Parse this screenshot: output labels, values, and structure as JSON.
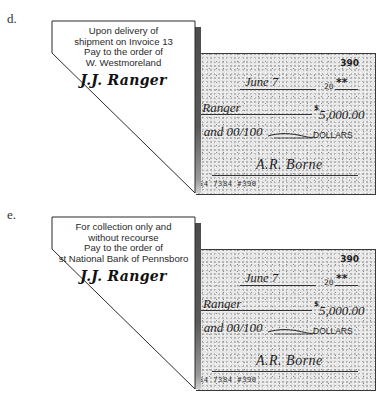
{
  "panels": [
    {
      "label": "d.",
      "endorsement": {
        "lines": [
          "Upon delivery of",
          "shipment on Invoice 13",
          "Pay to the order of",
          "W. Westmoreland"
        ],
        "signature": "J.J. Ranger"
      },
      "check": {
        "number": "390",
        "date": "June 7",
        "year_prefix": "20",
        "year_suffix": "**",
        "payee": "s Ranger",
        "currency_symbol": "$",
        "amount": "5,000.00",
        "amount_words": "d and 00/100",
        "dollars_label": "DOLLARS",
        "drawer_signature": "A.R. Borne",
        "micr": "854 7384  #390"
      }
    },
    {
      "label": "e.",
      "endorsement": {
        "lines": [
          "For collection only and",
          "without recourse",
          "Pay to the order of",
          "st National Bank of Pennsboro"
        ],
        "signature": "J.J. Ranger"
      },
      "check": {
        "number": "390",
        "date": "June 7",
        "year_prefix": "20",
        "year_suffix": "**",
        "payee": "e Ranger",
        "currency_symbol": "$",
        "amount": "5,000.00",
        "amount_words": "d and 00/100",
        "dollars_label": "DOLLARS",
        "drawer_signature": "A.R. Borne",
        "micr": "854 7384  #390"
      }
    }
  ]
}
